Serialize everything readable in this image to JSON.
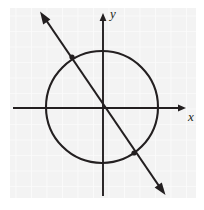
{
  "figure": {
    "background_color": "#ffffff",
    "plot_area_color": "#f4f4f4",
    "grid_color": "#fbfbfb",
    "ink_color": "#231f20",
    "plot_area": {
      "x": 10,
      "y": 8,
      "width": 186,
      "height": 190
    },
    "grid_spacing": 15.5
  },
  "axes": {
    "x_label": "x",
    "y_label": "y",
    "origin": {
      "x": 103,
      "y": 108
    },
    "x_axis": {
      "x1": 13,
      "y1": 108,
      "x2": 186,
      "y2": 108,
      "arrow": "right"
    },
    "y_axis": {
      "x1": 103,
      "y1": 196,
      "x2": 103,
      "y2": 14,
      "arrow": "up"
    },
    "x_label_pos": {
      "x": 188,
      "y": 121
    },
    "y_label_pos": {
      "x": 110,
      "y": 18
    }
  },
  "chart_data": {
    "type": "scatter",
    "xlabel": "x",
    "ylabel": "y",
    "grid": true,
    "legend": "none",
    "shapes": [
      {
        "name": "circle",
        "type": "circle",
        "center": {
          "x": 102,
          "y": 107
        },
        "radius": 56,
        "stroke": "#231f20",
        "stroke_width": 2,
        "fill": "none"
      },
      {
        "name": "line",
        "type": "line",
        "from": {
          "x": 40,
          "y": 12
        },
        "to": {
          "x": 165,
          "y": 195
        },
        "slope": -1.46,
        "stroke": "#231f20",
        "stroke_width": 2,
        "arrows": "both"
      }
    ],
    "points": [
      {
        "name": "upper-left-intersection",
        "x": 72,
        "y": 57
      },
      {
        "name": "lower-right-intersection",
        "x": 134,
        "y": 153
      }
    ]
  }
}
